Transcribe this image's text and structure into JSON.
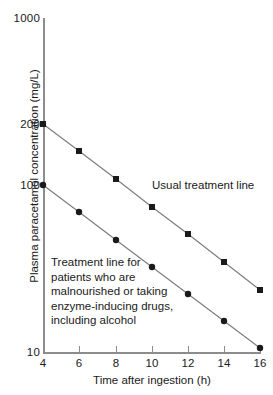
{
  "chart_data": {
    "type": "line",
    "title": "",
    "xlabel": "Time after ingestion (h)",
    "ylabel": "Plasma paracetamol concentration (mg/L)",
    "yscale": "log",
    "xlim": [
      4,
      16
    ],
    "ylim": [
      10,
      1000
    ],
    "xticks": [
      4,
      6,
      8,
      10,
      12,
      14,
      16
    ],
    "xticklabels": [
      "4",
      "6",
      "8",
      "10",
      "12",
      "14",
      "16"
    ],
    "yticks": [
      10,
      100,
      200,
      1000
    ],
    "yticklabels": [
      "10",
      "100",
      "200",
      "1000"
    ],
    "grid": false,
    "legend_position": "inline-annotations",
    "x": [
      4,
      6,
      8,
      10,
      12,
      14,
      16
    ],
    "series": [
      {
        "name": "Usual treatment line",
        "marker": "square",
        "color": "#1a1a1a",
        "values": [
          200,
          150,
          113,
          85,
          64,
          48,
          36
        ],
        "pixels": [
          {
            "x": 43,
            "y": 124
          },
          {
            "x": 79,
            "y": 151
          },
          {
            "x": 116,
            "y": 179
          },
          {
            "x": 152,
            "y": 207
          },
          {
            "x": 188,
            "y": 234
          },
          {
            "x": 224,
            "y": 262
          },
          {
            "x": 260,
            "y": 290
          }
        ]
      },
      {
        "name": "Treatment line for patients who are malnourished or taking enzyme-inducing drugs, including alcohol",
        "marker": "circle",
        "color": "#1a1a1a",
        "values": [
          100,
          75,
          56,
          42,
          32,
          24,
          18
        ],
        "pixels": [
          {
            "x": 43,
            "y": 185
          },
          {
            "x": 79,
            "y": 212
          },
          {
            "x": 116,
            "y": 240
          },
          {
            "x": 152,
            "y": 267
          },
          {
            "x": 188,
            "y": 294
          },
          {
            "x": 224,
            "y": 321
          },
          {
            "x": 260,
            "y": 348
          }
        ]
      }
    ],
    "annotations": [
      {
        "id": "usual",
        "text": "Usual treatment line"
      },
      {
        "id": "risk",
        "text": "Treatment line for patients who are malnourished or taking enzyme-inducing drugs, including alcohol"
      }
    ]
  },
  "axes": {
    "x_title": "Time after ingestion (h)",
    "y_title": "Plasma paracetamol concentration (mg/L)",
    "x_tick_labels": [
      "4",
      "6",
      "8",
      "10",
      "12",
      "14",
      "16"
    ],
    "y_tick_labels": {
      "top": "1000",
      "two_hundred": "200",
      "one_hundred": "100",
      "bottom": "10"
    }
  },
  "annotations": {
    "usual_line": "Usual treatment line",
    "risk_line_l1": "Treatment line for",
    "risk_line_l2": "patients who are",
    "risk_line_l3": "malnourished or taking",
    "risk_line_l4": "enzyme-inducing drugs,",
    "risk_line_l5": "including alcohol"
  },
  "colors": {
    "axis": "#8c8c8c",
    "data": "#1a1a1a",
    "background": "#ffffff"
  }
}
